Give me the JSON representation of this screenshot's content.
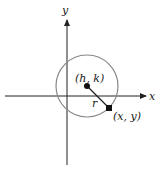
{
  "diagram": {
    "axes": {
      "x_label": "x",
      "y_label": "y"
    },
    "center_label": "(h, k)",
    "point_label": "(x, y)",
    "radius_label": "r",
    "colors": {
      "axis": "#222222",
      "circle": "#888888",
      "point": "#111111"
    }
  }
}
